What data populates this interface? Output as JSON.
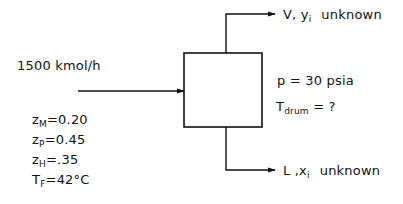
{
  "diagram": {
    "type": "flash-drum-flowsheet",
    "colors": {
      "line": "#111111",
      "background": "#ffffff"
    },
    "feed": {
      "flow_label": "1500 kmol/h",
      "composition": [
        {
          "var": "z",
          "sub": "M",
          "eq": "=",
          "value": "0.20"
        },
        {
          "var": "z",
          "sub": "P",
          "eq": "=",
          "value": "0.45"
        },
        {
          "var": "z",
          "sub": "H",
          "eq": "=",
          "value": ".35"
        },
        {
          "var": "T",
          "sub": "F",
          "eq": "=",
          "value": "42°C"
        }
      ]
    },
    "drum": {
      "pressure_label": "p = 30 psia",
      "temp_var": "T",
      "temp_sub": "drum",
      "temp_rest": " = ?"
    },
    "vapor": {
      "stream": "V, y",
      "sub": "i",
      "status": "unknown"
    },
    "liquid": {
      "stream": "L ,x",
      "sub": "i",
      "status": "unknown"
    }
  }
}
